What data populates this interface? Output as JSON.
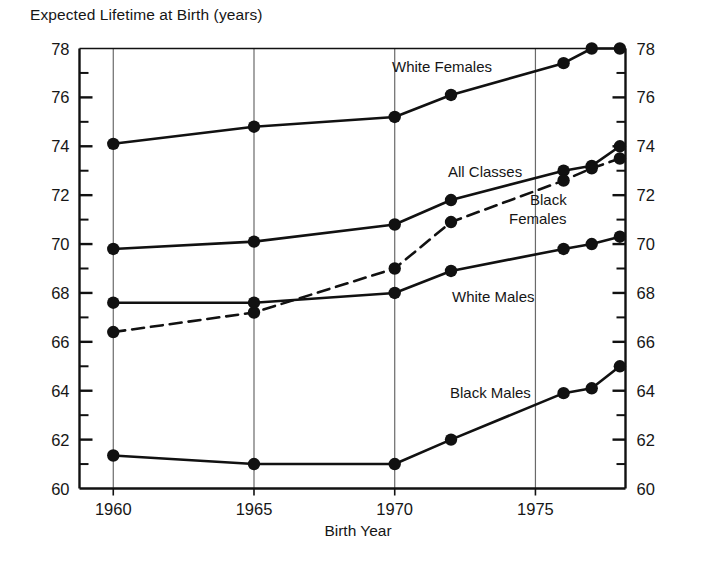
{
  "figure": {
    "title": "Expected Lifetime at Birth (years)",
    "xaxis_title": "Birth Year"
  },
  "axes": {
    "y_tick_labels": [
      "78",
      "76",
      "74",
      "72",
      "70",
      "68",
      "66",
      "64",
      "62",
      "60"
    ],
    "y_tick_labels_right": [
      "78",
      "76",
      "74",
      "72",
      "70",
      "68",
      "66",
      "64",
      "62",
      "60"
    ],
    "x_tick_labels": [
      "1960",
      "1965",
      "1970",
      "1975"
    ]
  },
  "series_labels": {
    "white_females": "White Females",
    "all_classes": "All Classes",
    "black_females_line1": "Black",
    "black_females_line2": "Females",
    "white_males": "White Males",
    "black_males": "Black Males"
  },
  "chart_data": {
    "type": "line",
    "title": "Expected Lifetime at Birth (years)",
    "xlabel": "Birth Year",
    "ylabel": "Expected Lifetime at Birth (years)",
    "xlim": [
      1958.8,
      1978.2
    ],
    "ylim": [
      60,
      78
    ],
    "y_major_ticks": [
      60,
      62,
      64,
      66,
      68,
      70,
      72,
      74,
      76,
      78
    ],
    "y_minor_ticks": [
      61,
      63,
      65,
      67,
      69,
      71,
      73,
      75,
      77
    ],
    "x_ticks": [
      1960,
      1965,
      1970,
      1975
    ],
    "grid": "vertical gridlines at x ticks only",
    "legend": "inline series labels placed next to curves",
    "series": [
      {
        "name": "White Females",
        "style": "solid",
        "marker": "filled-circle",
        "x": [
          1960,
          1965,
          1970,
          1972,
          1976,
          1977,
          1978
        ],
        "y": [
          74.1,
          74.8,
          75.2,
          76.1,
          77.4,
          78.0,
          78.0
        ]
      },
      {
        "name": "All Classes",
        "style": "solid",
        "marker": "filled-circle",
        "x": [
          1960,
          1965,
          1970,
          1972,
          1976,
          1977,
          1978
        ],
        "y": [
          69.8,
          70.1,
          70.8,
          71.8,
          73.0,
          73.2,
          74.0
        ]
      },
      {
        "name": "Black Females",
        "style": "dashed",
        "marker": "filled-circle",
        "x": [
          1960,
          1965,
          1970,
          1972,
          1976,
          1977,
          1978
        ],
        "y": [
          66.4,
          67.2,
          69.0,
          70.9,
          72.6,
          73.1,
          73.5
        ]
      },
      {
        "name": "White Males",
        "style": "solid",
        "marker": "filled-circle",
        "x": [
          1960,
          1965,
          1970,
          1972,
          1976,
          1977,
          1978
        ],
        "y": [
          67.6,
          67.6,
          68.0,
          68.9,
          69.8,
          70.0,
          70.3
        ]
      },
      {
        "name": "Black Males",
        "style": "solid",
        "marker": "filled-circle",
        "x": [
          1960,
          1965,
          1970,
          1972,
          1976,
          1977,
          1978
        ],
        "y": [
          61.35,
          61.0,
          61.0,
          62.0,
          63.9,
          64.1,
          65.0
        ]
      }
    ],
    "colors": {
      "line": "#111111",
      "axis": "#111111",
      "grid": "#6a6a6a",
      "background": "#ffffff"
    }
  }
}
